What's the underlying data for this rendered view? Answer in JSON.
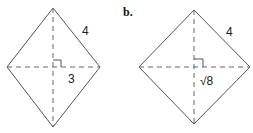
{
  "figures": [
    {
      "id": "a",
      "label": "",
      "side_label": "4",
      "half_diagonal_label": "3",
      "vertices": {
        "top": [
          53,
          8
        ],
        "left": [
          7,
          67
        ],
        "right": [
          100,
          67
        ],
        "bottom": [
          53,
          127
        ]
      }
    },
    {
      "id": "b",
      "label": "b.",
      "side_label": "4",
      "half_diagonal_label": "√8",
      "vertices": {
        "top": [
          194,
          10
        ],
        "left": [
          139,
          67
        ],
        "right": [
          250,
          67
        ],
        "bottom": [
          194,
          124
        ]
      }
    }
  ],
  "colors": {
    "stroke": "#555555",
    "dash": "#666666",
    "text": "#222222"
  }
}
